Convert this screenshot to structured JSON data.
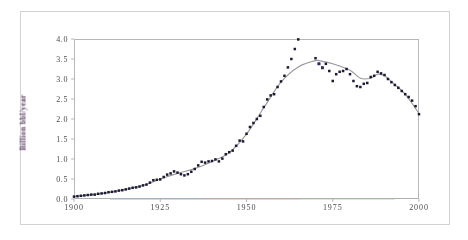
{
  "figure": {
    "caption_visible": false,
    "background_color": "#ffffff",
    "frame_color": "#d2d2d2",
    "axis_color": "#b7b7b7"
  },
  "axis": {
    "y_title": "Billion bbl/year",
    "y_ticks": [
      "4.0",
      "3.5",
      "3.0",
      "2.5",
      "2.0",
      "1.5",
      "1.0",
      "0.5",
      "0.0"
    ],
    "x_ticks": [
      "1900",
      "1925",
      "1950",
      "1975",
      "2000"
    ]
  },
  "style": {
    "marker_color": "#1b1b33",
    "marker_accent_color": "#2b2b66",
    "trend_line_color": "#9a9a9a",
    "tick_text_color": "#4a4a52",
    "y_title_color": "#5b3a63"
  },
  "chart_data": {
    "type": "scatter",
    "title": "",
    "xlabel": "",
    "ylabel": "Billion bbl/year",
    "xlim": [
      1900,
      2000
    ],
    "ylim": [
      0.0,
      4.0
    ],
    "xticks": [
      1900,
      1925,
      1950,
      1975,
      2000
    ],
    "yticks": [
      0.0,
      0.5,
      1.0,
      1.5,
      2.0,
      2.5,
      3.0,
      3.5,
      4.0
    ],
    "grid": false,
    "legend": "none",
    "series": [
      {
        "name": "Observed production",
        "type": "scatter",
        "marker": "square",
        "color": "#1b1b33",
        "x": [
          1900,
          1901,
          1902,
          1903,
          1904,
          1905,
          1906,
          1907,
          1908,
          1909,
          1910,
          1911,
          1912,
          1913,
          1914,
          1915,
          1916,
          1917,
          1918,
          1919,
          1920,
          1921,
          1922,
          1923,
          1924,
          1925,
          1926,
          1927,
          1928,
          1929,
          1930,
          1931,
          1932,
          1933,
          1934,
          1935,
          1936,
          1937,
          1938,
          1939,
          1940,
          1941,
          1942,
          1943,
          1944,
          1945,
          1946,
          1947,
          1948,
          1949,
          1950,
          1951,
          1952,
          1953,
          1954,
          1955,
          1956,
          1957,
          1958,
          1959,
          1960,
          1961,
          1962,
          1963,
          1964,
          1965,
          1966,
          1967,
          1968,
          1969,
          1970,
          1971,
          1972,
          1973,
          1974,
          1975,
          1976,
          1977,
          1978,
          1979,
          1980,
          1981,
          1982,
          1983,
          1984,
          1985,
          1986,
          1987,
          1988,
          1989,
          1990,
          1991,
          1992,
          1993,
          1994,
          1995,
          1996,
          1997,
          1998,
          1999,
          2000
        ],
        "y": [
          0.06,
          0.07,
          0.08,
          0.09,
          0.1,
          0.11,
          0.11,
          0.13,
          0.14,
          0.15,
          0.17,
          0.18,
          0.19,
          0.21,
          0.22,
          0.24,
          0.26,
          0.28,
          0.29,
          0.31,
          0.34,
          0.36,
          0.41,
          0.47,
          0.48,
          0.49,
          0.55,
          0.61,
          0.64,
          0.69,
          0.66,
          0.62,
          0.59,
          0.62,
          0.68,
          0.75,
          0.84,
          0.93,
          0.91,
          0.94,
          0.95,
          0.99,
          0.94,
          1.01,
          1.12,
          1.17,
          1.21,
          1.33,
          1.46,
          1.44,
          1.63,
          1.8,
          1.9,
          2.0,
          2.08,
          2.3,
          2.49,
          2.59,
          2.62,
          2.8,
          2.94,
          3.08,
          3.29,
          3.5,
          3.75,
          3.99,
          4.32,
          4.59,
          4.99,
          5.35,
          3.52,
          3.38,
          3.28,
          3.38,
          3.2,
          2.95,
          3.12,
          3.18,
          3.2,
          3.25,
          3.12,
          2.95,
          2.82,
          2.8,
          2.88,
          2.9,
          3.05,
          3.08,
          3.18,
          3.14,
          3.1,
          3.0,
          2.92,
          2.85,
          2.78,
          2.7,
          2.62,
          2.55,
          2.46,
          2.32,
          2.12
        ]
      },
      {
        "name": "Hubbert fit",
        "type": "line",
        "color": "#9a9a9a",
        "x": [
          1900,
          1910,
          1920,
          1925,
          1930,
          1935,
          1940,
          1945,
          1950,
          1955,
          1960,
          1965,
          1970,
          1972,
          1975,
          1980,
          1983,
          1986,
          1988,
          1990,
          1993,
          1996,
          2000
        ],
        "y": [
          0.06,
          0.16,
          0.34,
          0.5,
          0.64,
          0.76,
          0.94,
          1.16,
          1.62,
          2.28,
          2.92,
          3.3,
          3.46,
          3.44,
          3.38,
          3.22,
          3.02,
          3.02,
          3.12,
          3.08,
          2.86,
          2.62,
          2.14
        ]
      }
    ],
    "annotations": [
      {
        "text": "rapid growth phase",
        "visible": false
      },
      {
        "text": "peak",
        "visible": false
      }
    ]
  }
}
